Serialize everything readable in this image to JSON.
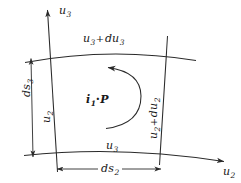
{
  "figure": {
    "type": "curvilinear-coordinate-element-diagram",
    "colors": {
      "background": "#ffffff",
      "stroke": "#2a2a2a",
      "text": "#181818"
    },
    "axes": [
      {
        "name": "u3-axis",
        "label": "u",
        "sub": "3",
        "direction": "up",
        "position": "top-left"
      },
      {
        "name": "u2-axis",
        "label": "u",
        "sub": "2",
        "direction": "right",
        "position": "bottom-right"
      }
    ],
    "labels": {
      "axis_u3": {
        "base": "u",
        "sub": "3"
      },
      "axis_u2": {
        "base": "u",
        "sub": "2"
      },
      "top_edge": {
        "base": "u",
        "sub": "3",
        "op": "+",
        "base2": "du",
        "sub2": "3"
      },
      "bottom_edge": {
        "base": "u",
        "sub": "3"
      },
      "left_edge": {
        "base": "u",
        "sub": "2"
      },
      "right_edge": {
        "base": "u",
        "sub": "2",
        "op": "+",
        "base2": "du",
        "sub2": "2"
      },
      "height_dim": {
        "base": "ds",
        "sub": "3"
      },
      "width_dim": {
        "base": "ds",
        "sub": "2"
      },
      "center_point": {
        "base": "i",
        "sub": "1",
        "dot": "·",
        "point": "P"
      }
    },
    "circulation": {
      "name": "circulation-arc",
      "sense": "counterclockwise",
      "about": "i1"
    }
  }
}
